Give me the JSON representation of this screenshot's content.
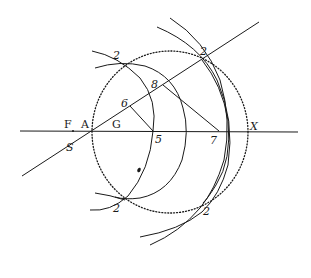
{
  "diagram": {
    "type": "geometric-construction",
    "colors": {
      "ink": "#1a1a1a",
      "paper": "#ffffff"
    },
    "labels": {
      "F": "F",
      "A": "A",
      "G": "G",
      "S": "S",
      "five": "5",
      "six": "6",
      "seven": "7",
      "eight": "8",
      "X": "X",
      "two_top_left": "2",
      "two_top_right": "2",
      "two_bottom_left": "2",
      "two_bottom_right": "2"
    },
    "points": [
      {
        "name": "F",
        "x": 72,
        "y": 131
      },
      {
        "name": "A",
        "x": 92,
        "y": 131
      },
      {
        "name": "G",
        "x": 117,
        "y": 131
      },
      {
        "name": "S",
        "x": 70,
        "y": 145
      },
      {
        "name": "5",
        "x": 153,
        "y": 131
      },
      {
        "name": "6",
        "x": 130,
        "y": 104
      },
      {
        "name": "7",
        "x": 219,
        "y": 131
      },
      {
        "name": "8",
        "x": 165,
        "y": 86
      },
      {
        "name": "X",
        "x": 247,
        "y": 131
      },
      {
        "name": "2",
        "x": 118,
        "y": 62
      },
      {
        "name": "2",
        "x": 202,
        "y": 58
      },
      {
        "name": "2",
        "x": 118,
        "y": 197
      },
      {
        "name": "2",
        "x": 201,
        "y": 205
      }
    ],
    "elements": {
      "axis_line": "horizontal line through F, A, G, 5, 7, X",
      "diagonal_line": "line through S, A, 6, 8, upper-right 2",
      "dotted_circle": "circle through A, X and the four points labelled 2",
      "segment_6_5": "segment from 6 to 5",
      "segment_8_7": "segment from 8 to 7"
    }
  }
}
